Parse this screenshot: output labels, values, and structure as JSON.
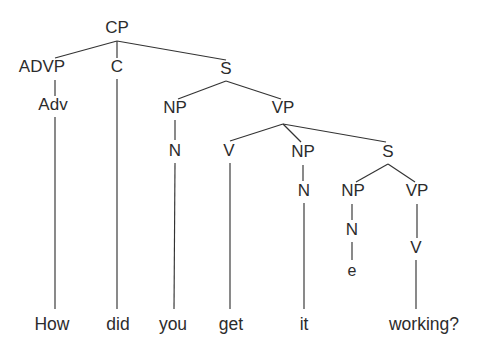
{
  "figure": {
    "kind": "constituency-syntax-tree",
    "sentence": "How did you get it working?",
    "background_color": "#ffffff",
    "ink_color": "#2c2c2c",
    "line_color": "#333333"
  },
  "nodes": {
    "cp": {
      "label": "CP",
      "x": 117,
      "y": 29
    },
    "advp": {
      "label": "ADVP",
      "x": 42,
      "y": 68
    },
    "c": {
      "label": "C",
      "x": 117,
      "y": 68
    },
    "s1": {
      "label": "S",
      "x": 226,
      "y": 70
    },
    "adv": {
      "label": "Adv",
      "x": 53,
      "y": 106
    },
    "np1": {
      "label": "NP",
      "x": 175,
      "y": 109
    },
    "vp1": {
      "label": "VP",
      "x": 283,
      "y": 109
    },
    "n1": {
      "label": "N",
      "x": 175,
      "y": 152
    },
    "v1": {
      "label": "V",
      "x": 229,
      "y": 152
    },
    "np2": {
      "label": "NP",
      "x": 303,
      "y": 153
    },
    "s2": {
      "label": "S",
      "x": 388,
      "y": 153
    },
    "n2": {
      "label": "N",
      "x": 304,
      "y": 192
    },
    "np3": {
      "label": "NP",
      "x": 353,
      "y": 192
    },
    "vp2": {
      "label": "VP",
      "x": 417,
      "y": 192
    },
    "n3": {
      "label": "N",
      "x": 352,
      "y": 231
    },
    "v2": {
      "label": "V",
      "x": 416,
      "y": 249
    },
    "empty": {
      "label": "e",
      "x": 352,
      "y": 272
    }
  },
  "leaves": [
    {
      "id": "leaf-how",
      "label": "How",
      "x": 52,
      "y": 330
    },
    {
      "id": "leaf-did",
      "label": "did",
      "x": 118,
      "y": 330
    },
    {
      "id": "leaf-you",
      "label": "you",
      "x": 173,
      "y": 330
    },
    {
      "id": "leaf-get",
      "label": "get",
      "x": 231,
      "y": 330
    },
    {
      "id": "leaf-it",
      "label": "it",
      "x": 304,
      "y": 330
    },
    {
      "id": "leaf-working",
      "label": "working?",
      "x": 424,
      "y": 330
    }
  ],
  "edges": [
    {
      "id": "cp-advp",
      "from": "CP",
      "to": "ADVP",
      "x1": 117,
      "y1": 41,
      "x2": 55,
      "y2": 58
    },
    {
      "id": "cp-c",
      "from": "CP",
      "to": "C",
      "x1": 117,
      "y1": 41,
      "x2": 117,
      "y2": 58
    },
    {
      "id": "cp-s",
      "from": "CP",
      "to": "S",
      "x1": 117,
      "y1": 41,
      "x2": 226,
      "y2": 60
    },
    {
      "id": "advp-adv",
      "from": "ADVP",
      "to": "Adv",
      "x1": 55,
      "y1": 80,
      "x2": 55,
      "y2": 96
    },
    {
      "id": "adv-how",
      "from": "Adv",
      "to": "How",
      "x1": 55,
      "y1": 117,
      "x2": 55,
      "y2": 309
    },
    {
      "id": "c-did",
      "from": "C",
      "to": "did",
      "x1": 117,
      "y1": 79,
      "x2": 117,
      "y2": 309
    },
    {
      "id": "s1-np1",
      "from": "S",
      "to": "NP",
      "x1": 226,
      "y1": 81,
      "x2": 178,
      "y2": 99
    },
    {
      "id": "s1-vp1",
      "from": "S",
      "to": "VP",
      "x1": 226,
      "y1": 81,
      "x2": 281,
      "y2": 99
    },
    {
      "id": "np1-n1",
      "from": "NP",
      "to": "N",
      "x1": 175,
      "y1": 120,
      "x2": 175,
      "y2": 140
    },
    {
      "id": "n1-you",
      "from": "N",
      "to": "you",
      "x1": 175,
      "y1": 163,
      "x2": 174,
      "y2": 309
    },
    {
      "id": "vp1-v1",
      "from": "VP",
      "to": "V",
      "x1": 283,
      "y1": 124,
      "x2": 230,
      "y2": 141
    },
    {
      "id": "vp1-np2",
      "from": "VP",
      "to": "NP",
      "x1": 283,
      "y1": 124,
      "x2": 301,
      "y2": 142
    },
    {
      "id": "vp1-s2",
      "from": "VP",
      "to": "S",
      "x1": 283,
      "y1": 124,
      "x2": 386,
      "y2": 142
    },
    {
      "id": "v1-get",
      "from": "V",
      "to": "get",
      "x1": 230,
      "y1": 163,
      "x2": 230,
      "y2": 309
    },
    {
      "id": "np2-n2",
      "from": "NP",
      "to": "N",
      "x1": 303,
      "y1": 165,
      "x2": 303,
      "y2": 181
    },
    {
      "id": "n2-it",
      "from": "N",
      "to": "it",
      "x1": 304,
      "y1": 203,
      "x2": 304,
      "y2": 309
    },
    {
      "id": "s2-np3",
      "from": "S",
      "to": "NP",
      "x1": 388,
      "y1": 164,
      "x2": 356,
      "y2": 182
    },
    {
      "id": "s2-vp2",
      "from": "S",
      "to": "VP",
      "x1": 388,
      "y1": 164,
      "x2": 415,
      "y2": 182
    },
    {
      "id": "np3-n3",
      "from": "NP",
      "to": "N",
      "x1": 352,
      "y1": 204,
      "x2": 352,
      "y2": 220
    },
    {
      "id": "n3-e",
      "from": "N",
      "to": "e",
      "x1": 352,
      "y1": 242,
      "x2": 352,
      "y2": 260
    },
    {
      "id": "vp2-v2",
      "from": "VP",
      "to": "V",
      "x1": 417,
      "y1": 204,
      "x2": 417,
      "y2": 238
    },
    {
      "id": "v2-work",
      "from": "V",
      "to": "working?",
      "x1": 416,
      "y1": 260,
      "x2": 416,
      "y2": 309
    }
  ]
}
